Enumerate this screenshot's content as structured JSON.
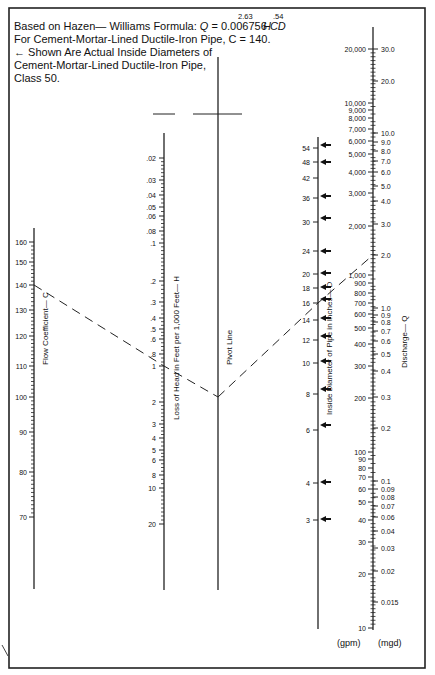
{
  "header": {
    "formula_prefix": "Based on Hazen— Williams Formula: ",
    "formula_q": "Q",
    "formula_mid": " = 0.006756 ",
    "formula_cd": "CD",
    "formula_exp1": "2.63",
    "formula_h": "H",
    "formula_exp2": ".54",
    "line2": "For Cement-Mortar-Lined Ductile-Iron Pipe, C = 140.",
    "line3": "←  Shown Are Actual Inside Diameters of",
    "line4": "Cement-Mortar-Lined Ductile-Iron Pipe,",
    "line5": "Class 50."
  },
  "axes": {
    "c": {
      "title": "Flow Coefficient— C",
      "ticks": [
        {
          "label": "160",
          "y": 242
        },
        {
          "label": "150",
          "y": 262
        },
        {
          "label": "140",
          "y": 285
        },
        {
          "label": "130",
          "y": 310
        },
        {
          "label": "120",
          "y": 336
        },
        {
          "label": "110",
          "y": 366
        },
        {
          "label": "100",
          "y": 397
        },
        {
          "label": "90",
          "y": 432
        },
        {
          "label": "80",
          "y": 472
        },
        {
          "label": "70",
          "y": 517
        }
      ]
    },
    "h": {
      "title": "Loss of Head in Feet per 1,000 Feet— H",
      "ticks": [
        {
          "label": ".02",
          "y": 158
        },
        {
          "label": ".03",
          "y": 180
        },
        {
          "label": ".04",
          "y": 195
        },
        {
          "label": ".05",
          "y": 207
        },
        {
          "label": ".06",
          "y": 216
        },
        {
          "label": ".08",
          "y": 231
        },
        {
          "label": ".1",
          "y": 243
        },
        {
          "label": ".2",
          "y": 281
        },
        {
          "label": ".3",
          "y": 302
        },
        {
          "label": ".4",
          "y": 318
        },
        {
          "label": ".5",
          "y": 329
        },
        {
          "label": ".6",
          "y": 339
        },
        {
          "label": ".8",
          "y": 354
        },
        {
          "label": "1",
          "y": 366
        },
        {
          "label": "2",
          "y": 402
        },
        {
          "label": "3",
          "y": 424
        },
        {
          "label": "4",
          "y": 438
        },
        {
          "label": "5",
          "y": 450
        },
        {
          "label": "6",
          "y": 460
        },
        {
          "label": "8",
          "y": 475
        },
        {
          "label": "10",
          "y": 488
        },
        {
          "label": "20",
          "y": 524
        }
      ]
    },
    "pivot": {
      "title": "Pivot Line"
    },
    "d": {
      "title": "Inside Diameter of Pipe in Inches— D",
      "ticks": [
        {
          "label": "54",
          "y": 148
        },
        {
          "label": "48",
          "y": 162
        },
        {
          "label": "42",
          "y": 178
        },
        {
          "label": "36",
          "y": 198
        },
        {
          "label": "30",
          "y": 222
        },
        {
          "label": "24",
          "y": 251
        },
        {
          "label": "20",
          "y": 274
        },
        {
          "label": "18",
          "y": 288
        },
        {
          "label": "16",
          "y": 303
        },
        {
          "label": "14",
          "y": 320
        },
        {
          "label": "12",
          "y": 340
        },
        {
          "label": "10",
          "y": 363
        },
        {
          "label": "8",
          "y": 394
        },
        {
          "label": "6",
          "y": 430
        },
        {
          "label": "4",
          "y": 483
        },
        {
          "label": "3",
          "y": 520
        }
      ],
      "arrows_y": [
        145,
        162,
        196,
        218,
        251,
        273,
        287,
        299,
        318,
        336,
        361,
        389,
        425,
        482,
        519
      ]
    },
    "q_gpm": {
      "unit": "(gpm)",
      "ticks": [
        {
          "label": "20,000",
          "y": 49
        },
        {
          "label": "10,000",
          "y": 103
        },
        {
          "label": "9,000",
          "y": 110
        },
        {
          "label": "8,000",
          "y": 118
        },
        {
          "label": "7,000",
          "y": 129
        },
        {
          "label": "6,000",
          "y": 141
        },
        {
          "label": "5,000",
          "y": 154
        },
        {
          "label": "4,000",
          "y": 172
        },
        {
          "label": "3,000",
          "y": 193
        },
        {
          "label": "2,000",
          "y": 226
        },
        {
          "label": "1,000",
          "y": 275
        },
        {
          "label": "900",
          "y": 283
        },
        {
          "label": "800",
          "y": 293
        },
        {
          "label": "700",
          "y": 303
        },
        {
          "label": "600",
          "y": 314
        },
        {
          "label": "500",
          "y": 328
        },
        {
          "label": "400",
          "y": 344
        },
        {
          "label": "300",
          "y": 366
        },
        {
          "label": "200",
          "y": 398
        },
        {
          "label": "100",
          "y": 452
        },
        {
          "label": "90",
          "y": 459
        },
        {
          "label": "80",
          "y": 468
        },
        {
          "label": "70",
          "y": 477
        },
        {
          "label": "60",
          "y": 489
        },
        {
          "label": "50",
          "y": 502
        },
        {
          "label": "40",
          "y": 520
        },
        {
          "label": "30",
          "y": 542
        },
        {
          "label": "20",
          "y": 574
        },
        {
          "label": "10",
          "y": 628
        }
      ]
    },
    "q_mgd": {
      "unit": "(mgd)",
      "title": "Discharge— Q",
      "ticks": [
        {
          "label": "30.0",
          "y": 49
        },
        {
          "label": "20.0",
          "y": 81
        },
        {
          "label": "10.0",
          "y": 133
        },
        {
          "label": "9.0",
          "y": 142
        },
        {
          "label": "8.0",
          "y": 151
        },
        {
          "label": "7.0",
          "y": 161
        },
        {
          "label": "6.0",
          "y": 172
        },
        {
          "label": "5.0",
          "y": 186
        },
        {
          "label": "4.0",
          "y": 201
        },
        {
          "label": "3.0",
          "y": 224
        },
        {
          "label": "2.0",
          "y": 255
        },
        {
          "label": "1.0",
          "y": 308
        },
        {
          "label": "0.9",
          "y": 315
        },
        {
          "label": "0.8",
          "y": 322
        },
        {
          "label": "0.7",
          "y": 331
        },
        {
          "label": "0.6",
          "y": 341
        },
        {
          "label": "0.5",
          "y": 354
        },
        {
          "label": "0.4",
          "y": 371
        },
        {
          "label": "0.3",
          "y": 397
        },
        {
          "label": "0.2",
          "y": 428
        },
        {
          "label": "0.1",
          "y": 481
        },
        {
          "label": "0.09",
          "y": 489
        },
        {
          "label": "0.08",
          "y": 497
        },
        {
          "label": "0.07",
          "y": 506
        },
        {
          "label": "0.06",
          "y": 517
        },
        {
          "label": "0.04",
          "y": 531
        },
        {
          "label": "0.03",
          "y": 548
        },
        {
          "label": "0.02",
          "y": 571
        },
        {
          "label": "0.015",
          "y": 602
        }
      ]
    }
  },
  "example_solution": {
    "c": "140",
    "h": "1",
    "d": "16",
    "q_mgd": "2.0",
    "pivot_y": 397
  },
  "colors": {
    "ink": "#111111",
    "frame": "#222222",
    "background": "#ffffff"
  }
}
